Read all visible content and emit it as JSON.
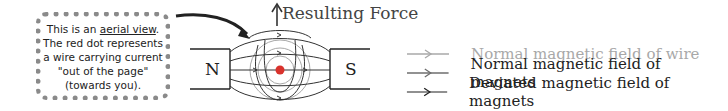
{
  "note": {
    "line1_prefix": "This is an ",
    "line1_underlined": "aerial view",
    "line1_suffix": ".",
    "rest": "The red dot represents\na wire carrying current\n\"out of the page\"\n(towards you)."
  },
  "diagram": {
    "force_label": "Resulting Force",
    "north_pole": "N",
    "south_pole": "S",
    "wire_color": "#d9322c"
  },
  "legend": {
    "items": [
      {
        "label": "Normal magnetic field of wire",
        "color": "#a8a8a8"
      },
      {
        "label": "Normal magnetic field of magnets",
        "color": "#222222"
      },
      {
        "label": "Deviated magnetic field of magnets",
        "color": "#222222"
      }
    ]
  },
  "colors": {
    "wire_field": "#a8a8a8",
    "magnet_field_normal": "#6e6e6e",
    "magnet_field_deviated": "#222222"
  }
}
